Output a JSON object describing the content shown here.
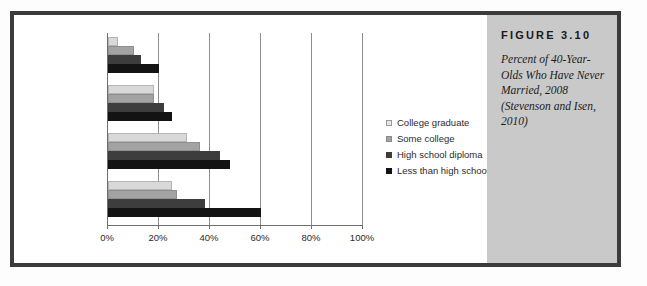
{
  "figure": {
    "number_label": "FIGURE  3.10",
    "caption": "Percent of 40-Year-Olds Who Have Never Married, 2008 (Stevenson and Isen, 2010)"
  },
  "chart_data": {
    "type": "bar",
    "orientation": "horizontal",
    "title": "",
    "xlabel": "",
    "ylabel": "",
    "xlim": [
      0,
      100
    ],
    "xtick_labels": [
      "0%",
      "20%",
      "40%",
      "60%",
      "80%",
      "100%"
    ],
    "xtick_values": [
      0,
      20,
      40,
      60,
      80,
      100
    ],
    "grid": true,
    "legend_position": "right",
    "categories": [
      "White women",
      "White men",
      "Black women",
      "Black men"
    ],
    "series": [
      {
        "name": "College graduate",
        "color": "#d9d9d9",
        "values": [
          4,
          18,
          31,
          25
        ]
      },
      {
        "name": "Some college",
        "color": "#a3a3a3",
        "values": [
          10,
          18,
          36,
          27
        ]
      },
      {
        "name": "High school diploma",
        "color": "#3d3d3d",
        "values": [
          13,
          22,
          44,
          38
        ]
      },
      {
        "name": "Less than high school",
        "color": "#131313",
        "values": [
          20,
          25,
          48,
          60
        ]
      }
    ]
  },
  "legend": {
    "items": [
      {
        "label": "College graduate"
      },
      {
        "label": "Some college"
      },
      {
        "label": "High school diploma"
      },
      {
        "label": "Less than high school"
      }
    ]
  }
}
